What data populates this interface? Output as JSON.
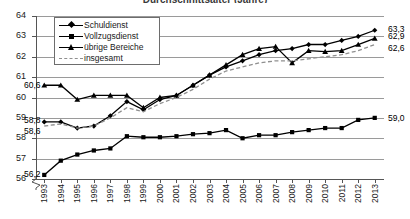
{
  "chart_data": {
    "type": "line",
    "title": "Durchschnittsalter (Jahre)",
    "xlabel": "",
    "ylabel": "",
    "ylim": [
      56,
      64
    ],
    "yticks": [
      56,
      57,
      58,
      59,
      60,
      61,
      62,
      63,
      64
    ],
    "ytick_labels": [
      "56",
      "57",
      "58",
      "59",
      "60",
      "61",
      "62",
      "63",
      "64"
    ],
    "axis_break": true,
    "grid": true,
    "legend_position": "top-left",
    "categories": [
      "1993",
      "1994",
      "1995",
      "1996",
      "1997",
      "1998",
      "1999",
      "2000",
      "2001",
      "2002",
      "2003",
      "2004",
      "2005",
      "2006",
      "2007",
      "2008",
      "2009",
      "2010",
      "2011",
      "2012",
      "2013"
    ],
    "series": [
      {
        "name": "Schuldienst",
        "marker": "diamond",
        "style": "solid",
        "values": [
          58.8,
          58.8,
          58.5,
          58.6,
          59.1,
          59.8,
          59.4,
          59.9,
          60.1,
          60.6,
          61.1,
          61.5,
          61.8,
          62.1,
          62.3,
          62.4,
          62.6,
          62.6,
          62.8,
          63.0,
          63.3
        ],
        "start_label": "58,8",
        "end_label": "63,3"
      },
      {
        "name": "Vollzugsdienst",
        "marker": "square",
        "style": "solid",
        "values": [
          56.2,
          56.9,
          57.2,
          57.4,
          57.5,
          58.1,
          58.05,
          58.05,
          58.1,
          58.2,
          58.25,
          58.4,
          58.0,
          58.15,
          58.15,
          58.3,
          58.4,
          58.5,
          58.5,
          58.9,
          59.0
        ],
        "start_label": "56,2",
        "end_label": "59,0"
      },
      {
        "name": "übrige Bereiche",
        "marker": "triangle",
        "style": "solid",
        "values": [
          60.6,
          60.6,
          59.9,
          60.1,
          60.1,
          60.1,
          59.5,
          60.0,
          60.1,
          60.6,
          61.1,
          61.6,
          62.1,
          62.4,
          62.5,
          61.7,
          62.3,
          62.25,
          62.3,
          62.6,
          62.9
        ],
        "start_label": "60,6",
        "end_label": "62,9"
      },
      {
        "name": "insgesamt",
        "marker": "none",
        "style": "dashed",
        "values": [
          58.6,
          58.7,
          58.5,
          58.6,
          59.0,
          59.5,
          59.3,
          59.7,
          60.0,
          60.4,
          60.9,
          61.3,
          61.5,
          61.7,
          61.8,
          61.8,
          61.9,
          62.0,
          62.1,
          62.3,
          62.6
        ],
        "start_label": "58,6",
        "end_label": "62,6"
      }
    ],
    "annotations_left": [
      "60,6",
      "58,8",
      "58,6",
      "56,2"
    ],
    "annotations_right": [
      "63,3",
      "62,9",
      "62,6",
      "59,0"
    ],
    "colors": {
      "line": "#000000",
      "dashed_line": "#8f8f8f",
      "grid": "#9a9a9a",
      "axis": "#555555",
      "text": "#1a1a1a"
    }
  },
  "legend": {
    "items": [
      {
        "label": "Schuldienst"
      },
      {
        "label": "Vollzugsdienst"
      },
      {
        "label": "übrige Bereiche"
      },
      {
        "label": "insgesamt"
      }
    ]
  }
}
